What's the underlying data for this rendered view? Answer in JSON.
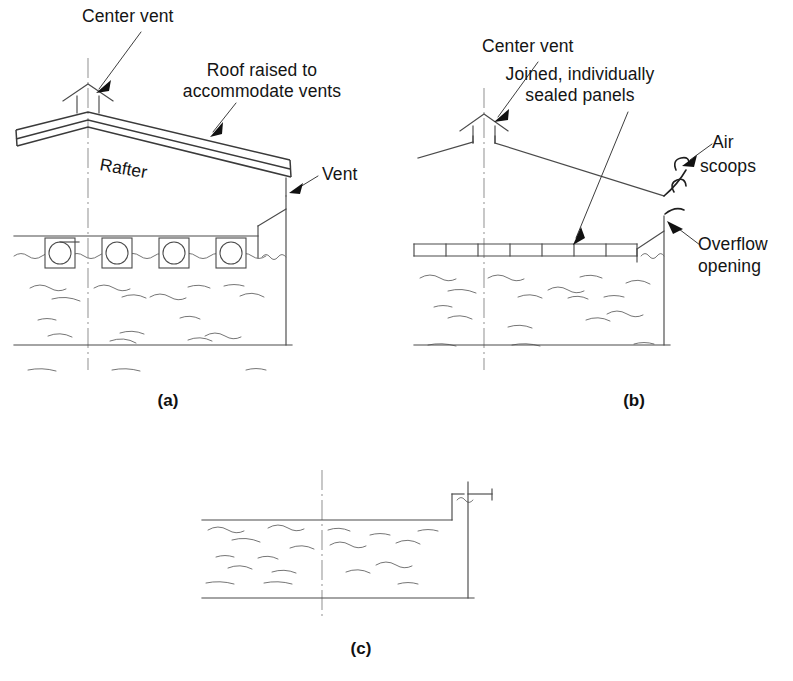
{
  "figure": {
    "width": 793,
    "height": 681,
    "background": "#ffffff",
    "line_color": "#4a4a4a",
    "text_color": "#141414"
  },
  "panels": [
    {
      "id": "a",
      "letter": "(a)",
      "letter_pos": {
        "x": 168,
        "y": 406
      },
      "description": "Rigid gabled roof cover with floats, center vent and perimeter vent",
      "labels": [
        {
          "name": "center-vent",
          "text": "Center vent",
          "x": 82,
          "y": 22,
          "anchor": "start",
          "leader": {
            "x1": 141,
            "y1": 32,
            "x2": 98,
            "y2": 90
          },
          "arrow": {
            "x": 95,
            "y": 93,
            "angle": 128
          }
        },
        {
          "name": "roof-raised",
          "line1": "Roof raised to",
          "line2": "accommodate vents",
          "x": 262,
          "y": 76,
          "anchor": "middle",
          "line_gap": 21,
          "leader": {
            "x1": 234,
            "y1": 105,
            "x2": 212,
            "y2": 133
          },
          "arrow": {
            "x": 210,
            "y": 136,
            "angle": 128
          }
        },
        {
          "name": "rafter",
          "text": "Rafter",
          "x": 99,
          "y": 170,
          "rotation": 10
        },
        {
          "name": "vent",
          "text": "Vent",
          "x": 322,
          "y": 180,
          "anchor": "start",
          "leader": {
            "x1": 318,
            "y1": 176,
            "x2": 293,
            "y2": 191
          },
          "arrow": {
            "x": 290,
            "y": 193,
            "angle": 210
          }
        }
      ],
      "floats_count": 4,
      "float_positions": [
        45,
        102,
        159,
        216
      ]
    },
    {
      "id": "b",
      "letter": "(b)",
      "letter_pos": {
        "x": 634,
        "y": 406
      },
      "description": "Flexible joined sealed panel cover with air scoops and overflow opening",
      "labels": [
        {
          "name": "center-vent",
          "text": "Center vent",
          "x": 482,
          "y": 52,
          "anchor": "start",
          "leader": {
            "x1": 538,
            "y1": 62,
            "x2": 497,
            "y2": 118
          },
          "arrow": {
            "x": 494,
            "y": 121,
            "angle": 128
          }
        },
        {
          "name": "joined-sealed-panels",
          "line1": "Joined, individually",
          "line2": "sealed panels",
          "x": 580,
          "y": 80,
          "anchor": "middle",
          "line_gap": 21,
          "leader": {
            "x1": 627,
            "y1": 112,
            "x2": 575,
            "y2": 240
          },
          "arrow": {
            "x": 573,
            "y": 244,
            "angle": 112
          }
        },
        {
          "name": "air-scoops",
          "line1": "Air",
          "line2": "scoops",
          "x": 712,
          "y": 148,
          "anchor": "start",
          "line_gap": 21,
          "leader": {
            "x1": 709,
            "y1": 146,
            "x2": 684,
            "y2": 164
          },
          "arrow": {
            "x": 681,
            "y": 166,
            "angle": 216
          }
        },
        {
          "name": "overflow-opening",
          "line1": "Overflow",
          "line2": "opening",
          "x": 698,
          "y": 250,
          "anchor": "start",
          "line_gap": 21,
          "leader": {
            "x1": 697,
            "y1": 243,
            "x2": 670,
            "y2": 224
          },
          "arrow": {
            "x": 667,
            "y": 221,
            "angle": 215
          }
        }
      ],
      "cover_segments": 7
    },
    {
      "id": "c",
      "letter": "(c)",
      "letter_pos": {
        "x": 361,
        "y": 654
      },
      "description": "Bank-to-bank floating cover with perimeter trench anchor",
      "labels": []
    }
  ],
  "icons": {
    "center_vent": "vent-cap-icon",
    "float": "float-ball-icon",
    "air_scoop": "air-scoop-icon",
    "water": "water-surface-icon",
    "centerline": "centerline-icon"
  }
}
